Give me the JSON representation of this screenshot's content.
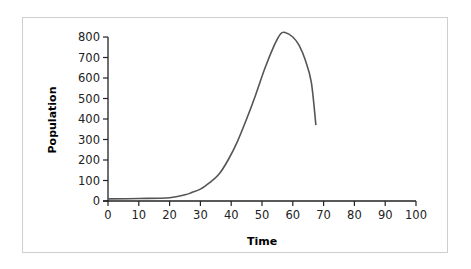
{
  "chart_data": {
    "type": "line",
    "title": "",
    "xlabel": "Time",
    "ylabel": "Population",
    "xlim": [
      0,
      100
    ],
    "ylim": [
      0,
      800
    ],
    "x_ticks": [
      0,
      10,
      20,
      30,
      40,
      50,
      60,
      70,
      80,
      90,
      100
    ],
    "y_ticks": [
      0,
      100,
      200,
      300,
      400,
      500,
      600,
      700,
      800
    ],
    "grid": false,
    "legend": null,
    "series": [
      {
        "name": "Population",
        "color": "#555555",
        "x": [
          0,
          10,
          20,
          25,
          27,
          30,
          33,
          36,
          39,
          42,
          45,
          48,
          51,
          54,
          56,
          57.5,
          60,
          62,
          64,
          66,
          67.5
        ],
        "y": [
          10,
          12,
          16,
          30,
          40,
          58,
          90,
          130,
          200,
          290,
          400,
          520,
          650,
          760,
          815,
          822,
          800,
          760,
          690,
          580,
          370
        ]
      }
    ]
  },
  "labels": {
    "x_axis_title": "Time",
    "y_axis_title": "Population"
  }
}
